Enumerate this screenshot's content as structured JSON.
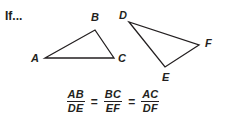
{
  "page": {
    "width": 226,
    "height": 124,
    "background_color": "#ffffff",
    "ink_color": "#231f20"
  },
  "prompt": {
    "text": "If..."
  },
  "figures": {
    "triangle_left": {
      "name": "triangle-ABC",
      "vertices": [
        {
          "label": "A",
          "x": 45,
          "y": 58
        },
        {
          "label": "B",
          "x": 95,
          "y": 30
        },
        {
          "label": "C",
          "x": 114,
          "y": 58
        }
      ]
    },
    "triangle_right": {
      "name": "triangle-DEF",
      "vertices": [
        {
          "label": "D",
          "x": 129,
          "y": 22
        },
        {
          "label": "E",
          "x": 165,
          "y": 67
        },
        {
          "label": "F",
          "x": 199,
          "y": 45
        }
      ]
    }
  },
  "equation": {
    "terms": [
      {
        "numerator": "AB",
        "denominator": "DE"
      },
      {
        "numerator": "BC",
        "denominator": "EF"
      },
      {
        "numerator": "AC",
        "denominator": "DF"
      }
    ],
    "operator": "=",
    "plain_text": "AB/DE = BC/EF = AC/DF"
  }
}
